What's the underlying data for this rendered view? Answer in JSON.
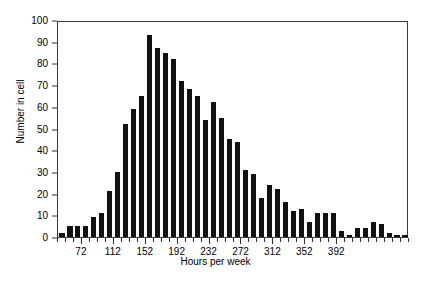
{
  "chart_data": {
    "type": "bar",
    "title": "",
    "subtitle": "",
    "xlabel": "Hours per week",
    "ylabel": "Number in cell",
    "ylim": [
      0,
      100
    ],
    "ytick_values": [
      0,
      10,
      20,
      30,
      40,
      50,
      60,
      70,
      80,
      90,
      100
    ],
    "xtick_labels": [
      "72",
      "112",
      "152",
      "192",
      "232",
      "272",
      "312",
      "352",
      "392"
    ],
    "xtick_values": [
      72,
      112,
      152,
      192,
      232,
      272,
      312,
      352,
      392
    ],
    "xlim": [
      42,
      482
    ],
    "bin_width": 10,
    "grid": false,
    "legend": false,
    "bar_color": "#111111",
    "axis_color": "#3a3a3a",
    "categories": [
      42,
      52,
      62,
      72,
      82,
      92,
      102,
      112,
      122,
      132,
      142,
      152,
      162,
      172,
      182,
      192,
      202,
      212,
      222,
      232,
      242,
      252,
      262,
      272,
      282,
      292,
      302,
      312,
      322,
      332,
      342,
      352,
      362,
      372,
      382,
      392,
      402,
      412,
      422,
      432,
      442,
      452,
      462,
      472
    ],
    "values": [
      2,
      5,
      5,
      5,
      9,
      11,
      21,
      30,
      52,
      59,
      65,
      93,
      87,
      85,
      82,
      72,
      68,
      65,
      54,
      62,
      55,
      45,
      44,
      31,
      29,
      18,
      24,
      22,
      16,
      12,
      13,
      7,
      11,
      11,
      11,
      3,
      1,
      4,
      4,
      7,
      6,
      2,
      1,
      1
    ],
    "peak": {
      "value": 93,
      "at": 152
    }
  }
}
